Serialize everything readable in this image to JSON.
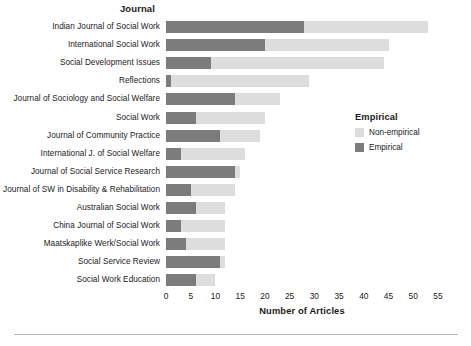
{
  "chart_data": {
    "type": "bar",
    "orientation": "horizontal",
    "stacked": true,
    "title": "",
    "xlabel": "Number of Articles",
    "ylabel": "Journal",
    "xlim": [
      0,
      55
    ],
    "xticks": [
      0,
      5,
      10,
      15,
      20,
      25,
      30,
      35,
      40,
      45,
      50,
      55
    ],
    "grid": false,
    "legend": {
      "title": "Empirical",
      "position": "right",
      "entries": [
        {
          "label": "Non-empirical",
          "color": "#dddddd"
        },
        {
          "label": "Empirical",
          "color": "#7c7c7c"
        }
      ]
    },
    "categories": [
      "Indian Journal of Social Work",
      "International Social Work",
      "Social Development Issues",
      "Reflections",
      "Journal of Sociology and Social Welfare",
      "Social Work",
      "Journal of Community Practice",
      "International J. of Social Welfare",
      "Journal of Social Service Research",
      "Journal of SW in Disability & Rehabilitation",
      "Australian Social Work",
      "China Journal of Social Work",
      "Maatskaplike Werk/Social Work",
      "Social Service Review",
      "Social Work Education"
    ],
    "series": [
      {
        "name": "Empirical",
        "color": "#7c7c7c",
        "values": [
          28,
          20,
          9,
          1,
          14,
          6,
          11,
          3,
          14,
          5,
          6,
          3,
          4,
          11,
          6
        ]
      },
      {
        "name": "Non-empirical",
        "color": "#dddddd",
        "values": [
          25,
          25,
          35,
          28,
          9,
          14,
          8,
          13,
          1,
          9,
          6,
          9,
          8,
          1,
          4
        ]
      }
    ],
    "totals": [
      53,
      45,
      44,
      29,
      23,
      20,
      19,
      16,
      15,
      14,
      12,
      12,
      12,
      12,
      10
    ]
  }
}
